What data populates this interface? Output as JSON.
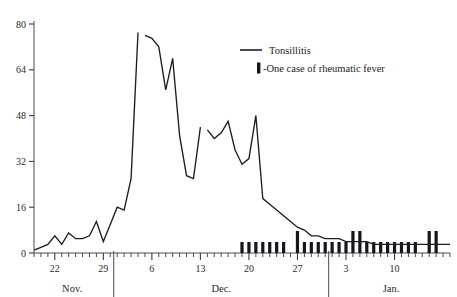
{
  "chart_data": {
    "type": "line",
    "title": "",
    "subtitle": "",
    "xlabel": "",
    "ylabel": "",
    "ylim": [
      0,
      80
    ],
    "yticks": [
      0,
      16,
      32,
      48,
      64,
      80
    ],
    "ytick_labels": [
      "0",
      "16",
      "32",
      "48",
      "64",
      "80"
    ],
    "grid": false,
    "legend_position": "upper-center-right",
    "x_axis_description": "Daily ticks spanning 19 Nov to 18 Jan; labels every 7 days",
    "month_groups": [
      {
        "label": "Nov.",
        "start_index": 0,
        "end_index": 11
      },
      {
        "label": "Dec.",
        "start_index": 12,
        "end_index": 42
      },
      {
        "label": "Jan.",
        "start_index": 43,
        "end_index": 60
      }
    ],
    "xtick_labels": [
      {
        "label": "22",
        "index": 3
      },
      {
        "label": "29",
        "index": 10
      },
      {
        "label": "6",
        "index": 17
      },
      {
        "label": "13",
        "index": 24
      },
      {
        "label": "20",
        "index": 31
      },
      {
        "label": "27",
        "index": 38
      },
      {
        "label": "3",
        "index": 45
      },
      {
        "label": "10",
        "index": 52
      }
    ],
    "series": [
      {
        "name": "Tonsillitis",
        "marker": "line",
        "x": [
          0,
          1,
          2,
          3,
          4,
          5,
          6,
          7,
          8,
          9,
          10,
          11,
          12,
          13,
          14,
          15,
          16,
          17,
          18,
          19,
          20,
          21,
          22,
          23,
          24,
          25,
          26,
          27,
          28,
          29,
          30,
          31,
          32,
          33,
          34,
          35,
          36,
          37,
          38,
          39,
          40,
          41,
          42,
          43,
          44,
          45,
          46,
          47,
          48,
          49,
          50,
          51,
          52,
          53,
          54,
          55,
          56,
          57,
          58,
          59,
          60
        ],
        "values": [
          1,
          2,
          3,
          6,
          3,
          7,
          5,
          5,
          6,
          11,
          4,
          10,
          16,
          15,
          26,
          77,
          76,
          75,
          72,
          57,
          68,
          41,
          27,
          26,
          44,
          43,
          40,
          42,
          46,
          36,
          31,
          33,
          48,
          19,
          17,
          15,
          13,
          11,
          9,
          8,
          6,
          6,
          5,
          5,
          5,
          4,
          4,
          4,
          4,
          3,
          3,
          3,
          3,
          3,
          3,
          3,
          3,
          3,
          3,
          3,
          3
        ]
      },
      {
        "name": "-One case of rheumatic fever",
        "marker": "bar",
        "note": "Each bar unit represents one case of rheumatic fever on that day",
        "x": [
          30,
          31,
          32,
          33,
          34,
          35,
          36,
          38,
          39,
          40,
          41,
          42,
          43,
          44,
          45,
          46,
          47,
          48,
          49,
          50,
          51,
          52,
          53,
          54,
          55,
          57,
          58
        ],
        "values": [
          1,
          1,
          1,
          1,
          1,
          1,
          1,
          2,
          1,
          1,
          1,
          1,
          1,
          1,
          1,
          2,
          2,
          1,
          1,
          1,
          1,
          1,
          1,
          1,
          1,
          2,
          2
        ]
      }
    ]
  },
  "legend": {
    "entries": [
      {
        "label": "Tonsillitis",
        "marker": "line"
      },
      {
        "label": "-One case of rheumatic fever",
        "marker": "bar"
      }
    ]
  },
  "colors": {
    "line": "#1d1d22",
    "bar": "#15151a",
    "axis": "#4a4a52",
    "text": "#2b2b2b",
    "background": "#ffffff"
  },
  "caption": {
    "text": ""
  }
}
